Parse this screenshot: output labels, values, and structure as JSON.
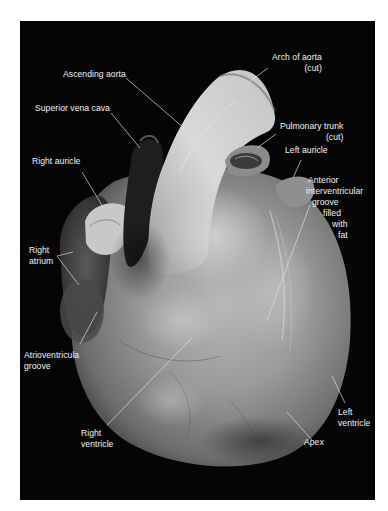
{
  "figure": {
    "background_color": "#050505",
    "label_color": "#f2f2f2",
    "leader_line_color": "#dcdcdc"
  },
  "labels": {
    "arch_of_aorta": {
      "line1": "Arch of aorta",
      "line2": "(cut)"
    },
    "ascending_aorta": {
      "line1": "Ascending aorta"
    },
    "superior_vena_cava": {
      "line1": "Superior vena cava"
    },
    "pulmonary_trunk": {
      "line1": "Pulmonary trunk",
      "line2": "(cut)"
    },
    "left_auricle": {
      "line1": "Left auricle"
    },
    "anterior_interventricular_groove": {
      "line1": "Anterior",
      "line2": "interventricular",
      "line3": "groove",
      "line4": "filled",
      "line5": "with",
      "line6": "fat"
    },
    "right_auricle": {
      "line1": "Right auricle"
    },
    "right_atrium": {
      "line1": "Right",
      "line2": "atrium"
    },
    "atrioventricular_groove": {
      "line1": "Atrioventricula",
      "line2": "groove"
    },
    "right_ventricle": {
      "line1": "Right",
      "line2": "ventricle"
    },
    "left_ventricle": {
      "line1": "Left",
      "line2": "ventricle"
    },
    "apex": {
      "line1": "Apex"
    }
  }
}
